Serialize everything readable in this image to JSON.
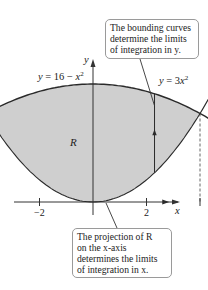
{
  "diagram": {
    "curves": [
      {
        "name": "upper",
        "label": "y = 16 − x²",
        "equation": "y = 16 - x^2"
      },
      {
        "name": "lower",
        "label": "y = 3x²",
        "equation": "y = 3x^2"
      }
    ],
    "region_label": "R",
    "axes": {
      "x_label": "x",
      "y_label": "y"
    },
    "x_ticks": [
      {
        "value": -2,
        "label": "−2"
      },
      {
        "value": -1,
        "label": ""
      },
      {
        "value": 1,
        "label": ""
      },
      {
        "value": 2,
        "label": "2"
      }
    ],
    "intersections": [
      [
        -2,
        12
      ],
      [
        2,
        12
      ]
    ],
    "x_range": [
      -3.0,
      3.2
    ],
    "y_range": [
      -2,
      19
    ],
    "sample_line_x": 1.15,
    "callouts": {
      "top": {
        "lines": [
          "The bounding curves",
          "determine the limits",
          "of integration in y."
        ]
      },
      "bottom": {
        "lines": [
          "The projection of R",
          "on the x-axis",
          "determines the limits",
          "of integration in x."
        ]
      }
    },
    "colors": {
      "region_fill": "#cfcfcf",
      "curve": "#2a2a2a",
      "axis": "#333333",
      "callout_border": "#9a9a9a"
    }
  }
}
